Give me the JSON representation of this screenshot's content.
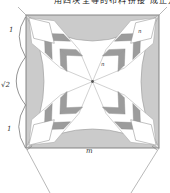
{
  "figure": {
    "caption_top": "用四块全等的布料拼接 成正方形的图案",
    "labels": {
      "side_top": "1",
      "side_middle": "√2",
      "side_bottom": "1",
      "bottom_edge": "m",
      "corner_diamond": "n",
      "center_blade": "n"
    },
    "colors": {
      "background": "#ffffff",
      "border_band": "#cbcbcb",
      "dark_patch": "#9c9c9c",
      "light_patch": "#ffffff",
      "line": "#888888",
      "text": "#333333"
    }
  }
}
